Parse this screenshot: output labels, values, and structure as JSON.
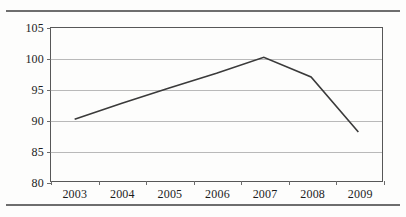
{
  "figure": {
    "background_color": "#fdfdfc",
    "rule_color": "#6e6e6e",
    "frame_color": "#575757",
    "gridline_color": "#b9b9b9",
    "series_color": "#3a3a3a"
  },
  "chart_data": {
    "type": "line",
    "title": "",
    "subtitle": "",
    "xlabel": "",
    "ylabel": "",
    "categories": [
      "2003",
      "2004",
      "2005",
      "2006",
      "2007",
      "2008",
      "2009"
    ],
    "x": [
      2003,
      2004,
      2005,
      2006,
      2007,
      2008,
      2009
    ],
    "values": [
      90.1,
      92.7,
      95.2,
      97.6,
      100.2,
      97.0,
      88.0
    ],
    "series": [
      {
        "name": "",
        "values": [
          90.1,
          92.7,
          95.2,
          97.6,
          100.2,
          97.0,
          88.0
        ]
      }
    ],
    "ylim": [
      80,
      105
    ],
    "yticks": [
      80,
      85,
      90,
      95,
      100,
      105
    ],
    "ytick_labels": [
      "80",
      "85",
      "90",
      "95",
      "100",
      "105"
    ],
    "xtick_labels": [
      "2003",
      "2004",
      "2005",
      "2006",
      "2007",
      "2008",
      "2009"
    ],
    "grid": true,
    "grid_axis": "y",
    "legend": false,
    "legend_position": "none",
    "markers": false,
    "annotations": []
  }
}
